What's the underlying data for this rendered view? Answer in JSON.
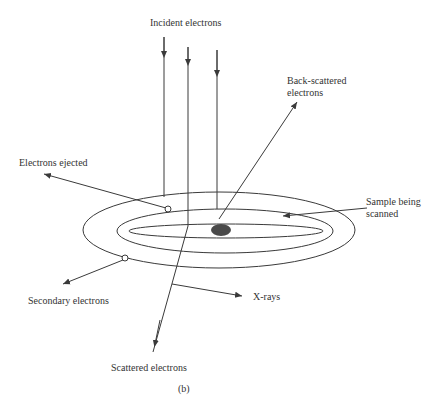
{
  "diagram": {
    "caption": "(b)",
    "labels": {
      "incident": "Incident electrons",
      "backscattered_line1": "Back-scattered",
      "backscattered_line2": "electrons",
      "ejected": "Electrons ejected",
      "sample_line1": "Sample being",
      "sample_line2": "scanned",
      "secondary": "Secondary electrons",
      "xrays": "X-rays",
      "scattered": "Scattered electrons"
    },
    "colors": {
      "line": "#3a3a3a",
      "spot": "#4a4a4a",
      "text": "#333333",
      "background": "#ffffff"
    }
  }
}
